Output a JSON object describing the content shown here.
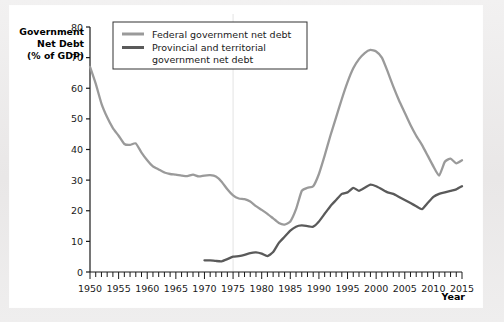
{
  "chart_data": {
    "type": "line",
    "title": "",
    "ylabel_lines": [
      "Government",
      "Net Debt",
      "(% of GDP)"
    ],
    "xlabel": "Year",
    "xlim": [
      1950,
      2015
    ],
    "ylim": [
      0,
      80
    ],
    "yticks": [
      0,
      10,
      20,
      30,
      40,
      50,
      60,
      70,
      80
    ],
    "xticks": [
      1950,
      1955,
      1960,
      1965,
      1970,
      1975,
      1980,
      1985,
      1990,
      1995,
      2000,
      2005,
      2010,
      2015
    ],
    "x_minor_tick_interval": 1,
    "grid": false,
    "legend_position": "top-left-inside",
    "series": [
      {
        "name": "Federal government net debt",
        "color": "#9a9a9a",
        "x": [
          1950,
          1951,
          1952,
          1953,
          1954,
          1955,
          1956,
          1957,
          1958,
          1959,
          1960,
          1961,
          1962,
          1963,
          1964,
          1965,
          1966,
          1967,
          1968,
          1969,
          1970,
          1971,
          1972,
          1973,
          1974,
          1975,
          1976,
          1977,
          1978,
          1979,
          1980,
          1981,
          1982,
          1983,
          1984,
          1985,
          1986,
          1987,
          1988,
          1989,
          1990,
          1991,
          1992,
          1993,
          1994,
          1995,
          1996,
          1997,
          1998,
          1999,
          2000,
          2001,
          2002,
          2003,
          2004,
          2005,
          2006,
          2007,
          2008,
          2009,
          2010,
          2011,
          2012,
          2013,
          2014,
          2015
        ],
        "values": [
          67.0,
          61.5,
          55.0,
          50.5,
          47.0,
          44.5,
          41.8,
          41.5,
          42.0,
          39.0,
          36.5,
          34.5,
          33.5,
          32.5,
          32.0,
          31.8,
          31.5,
          31.3,
          31.8,
          31.2,
          31.5,
          31.6,
          31.2,
          29.5,
          27.0,
          25.0,
          24.0,
          23.8,
          23.0,
          21.5,
          20.3,
          19.0,
          17.5,
          16.0,
          15.5,
          16.5,
          20.5,
          26.5,
          27.5,
          28.0,
          32.0,
          38.0,
          44.5,
          50.5,
          56.5,
          62.0,
          66.5,
          69.5,
          71.5,
          72.5,
          72.0,
          70.0,
          65.5,
          60.5,
          56.0,
          52.0,
          48.0,
          44.5,
          41.5,
          38.0,
          34.5,
          31.5,
          36.0,
          37.0,
          35.5,
          36.5
        ]
      },
      {
        "name": "Provincial and territorial government net debt",
        "color": "#5a5a5a",
        "x": [
          1970,
          1971,
          1972,
          1973,
          1974,
          1975,
          1976,
          1977,
          1978,
          1979,
          1980,
          1981,
          1982,
          1983,
          1984,
          1985,
          1986,
          1987,
          1988,
          1989,
          1990,
          1991,
          1992,
          1993,
          1994,
          1995,
          1996,
          1997,
          1998,
          1999,
          2000,
          2001,
          2002,
          2003,
          2004,
          2005,
          2006,
          2007,
          2008,
          2009,
          2010,
          2011,
          2012,
          2013,
          2014,
          2015
        ],
        "values": [
          3.8,
          3.8,
          3.6,
          3.5,
          4.2,
          5.0,
          5.2,
          5.6,
          6.2,
          6.4,
          6.0,
          5.2,
          6.5,
          9.5,
          11.5,
          13.5,
          14.8,
          15.2,
          15.0,
          14.8,
          16.5,
          19.0,
          21.5,
          23.5,
          25.5,
          26.0,
          27.5,
          26.5,
          27.5,
          28.5,
          28.0,
          27.0,
          26.0,
          25.5,
          24.5,
          23.5,
          22.5,
          21.5,
          20.5,
          22.5,
          24.5,
          25.5,
          26.0,
          26.5,
          27.0,
          28.0
        ]
      }
    ]
  },
  "legend": {
    "items": [
      {
        "label": "Federal government net debt"
      },
      {
        "label": "Provincial and territorial"
      },
      {
        "label": "government net debt"
      }
    ]
  },
  "axis": {
    "x_title": "Year",
    "y_title_line1": "Government",
    "y_title_line2": "Net Debt",
    "y_title_line3": "(% of GDP)"
  }
}
